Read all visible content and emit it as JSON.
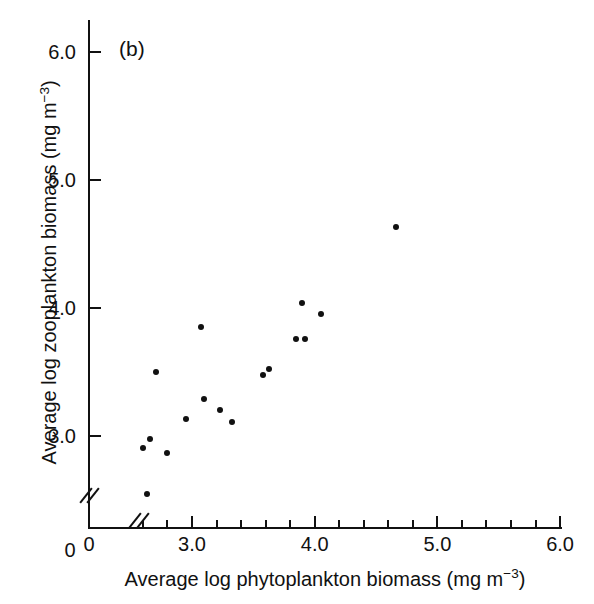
{
  "figure": {
    "panel_label": "(b)",
    "background": "#ffffff",
    "marker_color": "#111111",
    "axis_color": "#111111"
  },
  "axes": {
    "x": {
      "title_main": "Average log phytoplankton biomass (mg m",
      "title_exp": "−3",
      "title_close": ")",
      "title_full": "Average log phytoplankton biomass (mg m−3)",
      "origin_label": "0",
      "ticks": [
        "3.0",
        "4.0",
        "5.0",
        "6.0"
      ],
      "tick_values": [
        3.0,
        4.0,
        5.0,
        6.0
      ],
      "minor_step": 0.2,
      "has_break": true
    },
    "y": {
      "title_main": "Average log zooplankton biomass (mg m",
      "title_exp": "−3",
      "title_close": ")",
      "title_full": "Average log zooplankton biomass (mg m−3)",
      "origin_label": "0",
      "ticks": [
        "3.0",
        "4.0",
        "5.0",
        "6.0"
      ],
      "tick_values": [
        3.0,
        4.0,
        5.0,
        6.0
      ],
      "has_break": true
    }
  },
  "chart_data": {
    "type": "scatter",
    "title": "(b)",
    "xlabel": "Average log phytoplankton biomass (mg m−3)",
    "ylabel": "Average log zooplankton biomass (mg m−3)",
    "xlim": [
      2.55,
      6.0
    ],
    "ylim": [
      2.45,
      6.1
    ],
    "xticks": [
      3.0,
      4.0,
      5.0,
      6.0
    ],
    "yticks": [
      3.0,
      4.0,
      5.0,
      6.0
    ],
    "grid": false,
    "legend": null,
    "axis_breaks": {
      "x": "between 0 and 3.0",
      "y": "between 0 and 3.0"
    },
    "series": [
      {
        "name": "lakes",
        "marker": "filled-circle",
        "color": "#111111",
        "points": [
          {
            "x": 2.71,
            "y": 3.5
          },
          {
            "x": 2.6,
            "y": 2.91
          },
          {
            "x": 2.66,
            "y": 2.98
          },
          {
            "x": 2.63,
            "y": 2.55
          },
          {
            "x": 2.8,
            "y": 2.87
          },
          {
            "x": 2.95,
            "y": 3.13
          },
          {
            "x": 3.07,
            "y": 3.85
          },
          {
            "x": 3.1,
            "y": 3.29
          },
          {
            "x": 3.23,
            "y": 3.2
          },
          {
            "x": 3.33,
            "y": 3.11
          },
          {
            "x": 3.58,
            "y": 3.48
          },
          {
            "x": 3.63,
            "y": 3.52
          },
          {
            "x": 3.85,
            "y": 3.76
          },
          {
            "x": 3.9,
            "y": 4.04
          },
          {
            "x": 3.92,
            "y": 3.76
          },
          {
            "x": 4.05,
            "y": 3.95
          },
          {
            "x": 4.66,
            "y": 4.63
          }
        ]
      }
    ]
  }
}
